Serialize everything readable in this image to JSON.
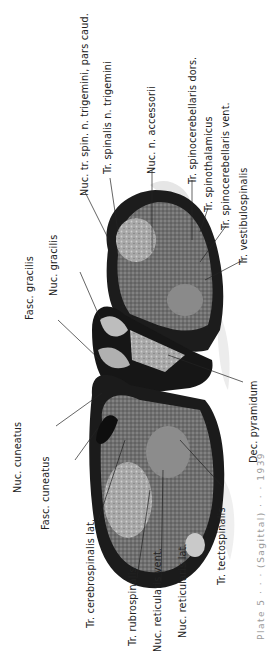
{
  "figure": {
    "labels_top": [
      {
        "id": "nuc-tr-spin-trigemini",
        "text": "Nuc. tr. spin. n. trigemini, pars caud."
      },
      {
        "id": "tr-spinalis-trigemini",
        "text": "Tr. spinalis n. trigemini"
      },
      {
        "id": "nuc-n-accessorii",
        "text": "Nuc. n. accessorii"
      },
      {
        "id": "tr-spinocerebellaris-dors",
        "text": "Tr. spinocerebellaris dors."
      },
      {
        "id": "tr-spinothalamicus",
        "text": "Tr. spinothalamicus"
      },
      {
        "id": "tr-spinocerebellaris-vent",
        "text": "Tr. spinocerebellaris vent."
      },
      {
        "id": "tr-vestibulospinalis",
        "text": "Tr. vestibulospinalis"
      }
    ],
    "labels_left": [
      {
        "id": "fasc-gracilis",
        "text": "Fasc. gracilis"
      },
      {
        "id": "nuc-gracilis",
        "text": "Nuc. gracilis"
      },
      {
        "id": "nuc-cuneatus",
        "text": "Nuc. cuneatus"
      },
      {
        "id": "fasc-cuneatus",
        "text": "Fasc. cuneatus"
      }
    ],
    "labels_bottom": [
      {
        "id": "tr-cerebrospinalis-lat",
        "text": "Tr. cerebrospinalis lat."
      },
      {
        "id": "tr-rubrospinalis",
        "text": "Tr. rubrospinalis"
      },
      {
        "id": "nuc-reticularis-vent",
        "text": "Nuc. reticularis vent."
      },
      {
        "id": "nuc-reticularis-lat",
        "text": "Nuc. reticularis lat."
      },
      {
        "id": "tr-tectospinalis",
        "text": "Tr. tectospinalis"
      },
      {
        "id": "dec-pyramidum",
        "text": "Dec. pyramidum"
      }
    ],
    "caption_fragment": "Plate 5  ·  ·  ·  (Sagittal)  ·  ·  ·  1939"
  }
}
